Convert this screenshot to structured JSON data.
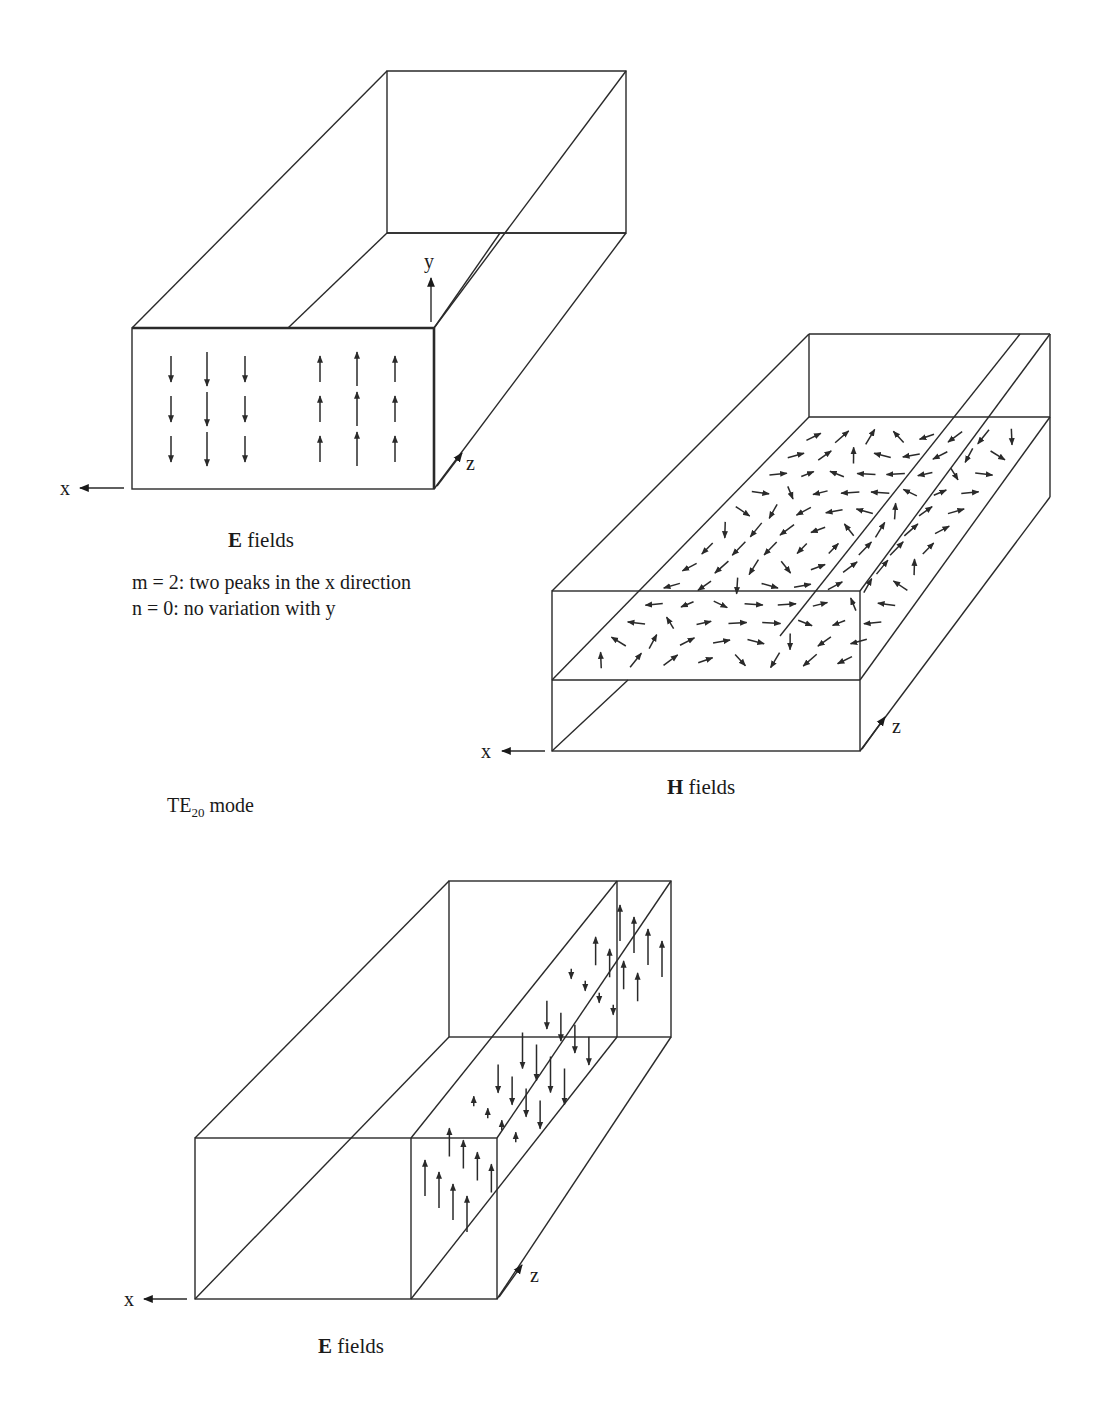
{
  "mode_label": {
    "prefix": "TE",
    "subscript": "20",
    "suffix": " mode"
  },
  "panels": [
    {
      "id": "e-fields-cross-section",
      "caption_bold": "E",
      "caption_rest": " fields",
      "notes": [
        "m = 2:  two peaks in the x direction",
        "n = 0:  no variation with y"
      ],
      "axes": {
        "x": "x",
        "y": "y",
        "z": "z"
      },
      "box": {
        "front": [
          [
            132,
            328
          ],
          [
            434,
            328
          ],
          [
            434,
            489
          ],
          [
            132,
            489
          ]
        ],
        "back": [
          [
            387,
            71
          ],
          [
            626,
            71
          ],
          [
            626,
            233
          ],
          [
            387,
            233
          ]
        ],
        "mid_top": [
          [
            288,
            328
          ],
          [
            546,
            71
          ]
        ]
      },
      "arrows": {
        "description": "left peak points down (-y), right peak points up (+y); 3 rows x 3 columns each, center column longest",
        "columns": [
          {
            "x": 171,
            "dir": "down",
            "len": 26
          },
          {
            "x": 207,
            "dir": "down",
            "len": 34
          },
          {
            "x": 245,
            "dir": "down",
            "len": 26
          },
          {
            "x": 320,
            "dir": "up",
            "len": 26
          },
          {
            "x": 357,
            "dir": "up",
            "len": 34
          },
          {
            "x": 395,
            "dir": "up",
            "len": 26
          }
        ],
        "rows": [
          369,
          409,
          449
        ]
      }
    },
    {
      "id": "h-fields-longitudinal",
      "caption_bold": "H",
      "caption_rest": " fields",
      "axes": {
        "x": "x",
        "z": "z"
      },
      "description": "H-field loops in the xz-plane at mid-height; two columns of closed loops alternating circulation along z"
    },
    {
      "id": "e-fields-longitudinal",
      "caption_bold": "E",
      "caption_rest": " fields",
      "axes": {
        "x": "x",
        "z": "z"
      },
      "description": "E-field vectors in a yz-plane slice, alternating up/down along z"
    }
  ]
}
